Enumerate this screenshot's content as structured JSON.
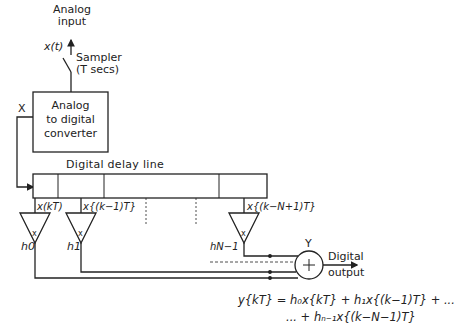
{
  "input": {
    "label_line1": "Analog",
    "label_line2": "input",
    "signal": "x(t)"
  },
  "sampler": {
    "label_line1": "Sampler",
    "label_line2": "(T secs)"
  },
  "adc": {
    "line1": "Analog",
    "line2": "to digital",
    "line3": "converter",
    "node_label": "X"
  },
  "delay_line": {
    "title": "Digital  delay line",
    "taps": [
      {
        "signal": "x(kT)",
        "coefficient": "h0"
      },
      {
        "signal": "x{(k−1)T}",
        "coefficient": "h1"
      },
      {
        "signal": "x{(k−N+1)T}",
        "coefficient": "hN−1"
      }
    ],
    "multiplier_symbol": "x"
  },
  "summer": {
    "node_label": "Y",
    "symbol": "+",
    "output_line1": "Digital",
    "output_line2": "output"
  },
  "equation": {
    "line1": "y{kT} = h₀x{kT} + h₁x{(k−1)T} + ...",
    "line2": "... + hₙ₋₁x{(k−N−1)T}"
  }
}
